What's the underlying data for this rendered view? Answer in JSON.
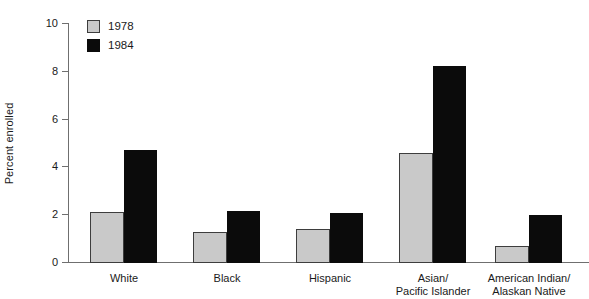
{
  "chart_data": {
    "type": "bar",
    "title": "",
    "xlabel": "",
    "ylabel": "Percent enrolled",
    "ylim": [
      0,
      10
    ],
    "yticks": [
      0,
      2,
      4,
      6,
      8,
      10
    ],
    "ytick_labels": [
      "0",
      "2",
      "4",
      "6",
      "8",
      "10"
    ],
    "grid": false,
    "legend_position": "top-left",
    "categories": [
      "White",
      "Black",
      "Hispanic",
      "Asian/\nPacific Islander",
      "American Indian/\nAlaskan Native"
    ],
    "series": [
      {
        "name": "1978",
        "color": "#c9c9c9",
        "values": [
          2.1,
          1.25,
          1.4,
          4.55,
          0.65
        ]
      },
      {
        "name": "1984",
        "color": "#0b0b0b",
        "values": [
          4.7,
          2.15,
          2.05,
          8.2,
          1.95
        ]
      }
    ]
  },
  "legend": {
    "items": [
      {
        "label": "1978",
        "swatch": "legend-swatch-1978"
      },
      {
        "label": "1984",
        "swatch": "legend-swatch-1984"
      }
    ]
  },
  "axis": {
    "y_label": "Percent enrolled"
  }
}
